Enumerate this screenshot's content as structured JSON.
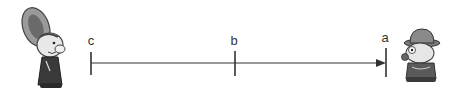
{
  "diagram": {
    "type": "number-line",
    "points": [
      {
        "id": "c",
        "label": "c",
        "x": 91
      },
      {
        "id": "b",
        "label": "b",
        "x": 235
      },
      {
        "id": "a",
        "label": "a",
        "x": 386
      }
    ],
    "arrow_direction": "toward a",
    "line_color": "#333333",
    "left_figure": "cartoon-character-with-hat-left",
    "right_figure": "cartoon-character-with-hat-right"
  }
}
